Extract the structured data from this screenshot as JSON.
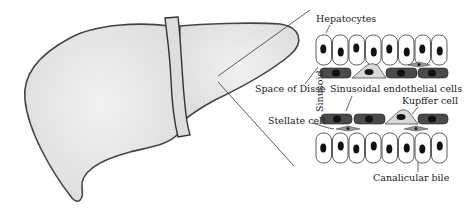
{
  "labels": {
    "hepatocytes": "Hepatocytes",
    "space_of_disse": "Space of Disse",
    "sinusoid": "Sinusoid",
    "sinusoidal_endothelial_cells": "Sinusoidal endothelial cells",
    "kupffer_cell": "Kupffer cell",
    "stellate_cell": "Stellate cell",
    "canalicular_bile": "Canalicular bile"
  },
  "colors": {
    "liver_fill": "#e9e9e9",
    "liver_stroke": "#444444",
    "hepatocyte_fill": "#ffffff",
    "nucleus": "#111111",
    "endothelial_fill": "#4a4a4a",
    "kupffer_fill": "#d9d9d9",
    "stellate_fill": "#9a9a9a"
  }
}
